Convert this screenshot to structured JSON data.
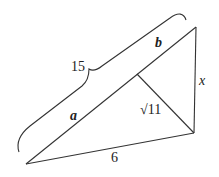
{
  "diagram": {
    "type": "right-triangle-with-altitude",
    "labels": {
      "hypotenuse_total": "15",
      "segment_a": "a",
      "segment_b": "b",
      "altitude": "√11",
      "leg_bottom": "6",
      "leg_right": "x"
    },
    "colors": {
      "stroke": "#333333",
      "background": "#ffffff"
    }
  }
}
